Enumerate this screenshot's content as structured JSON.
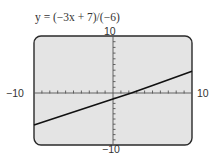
{
  "chart_data": {
    "type": "line",
    "title": "y = (−3x + 7)/(−6)",
    "equation": "y = (-3x + 7)/(-6)",
    "xlabel": "",
    "ylabel": "",
    "xlim": [
      -10,
      10
    ],
    "ylim": [
      -10,
      10
    ],
    "x_tick_labels": {
      "min": "−10",
      "max": "10"
    },
    "y_tick_labels": {
      "min": "−10",
      "max": "10"
    },
    "x_ticks_step": 1,
    "y_ticks_step": 1,
    "grid": false,
    "legend": null,
    "series": [
      {
        "name": "y = (-3x + 7)/(-6)",
        "x": [
          -10,
          -5,
          0,
          2.333,
          5,
          10
        ],
        "y": [
          -6.167,
          -3.667,
          -1.167,
          0,
          1.333,
          3.833
        ]
      }
    ]
  },
  "labels": {
    "title": "y = (−3x + 7)/(−6)",
    "y_max": "10",
    "y_min": "−10",
    "x_min": "−10",
    "x_max": "10"
  },
  "colors": {
    "screen_fill": "#e4e4e4",
    "frame": "#2a2a2a",
    "axis": "#555555",
    "line": "#111111"
  }
}
